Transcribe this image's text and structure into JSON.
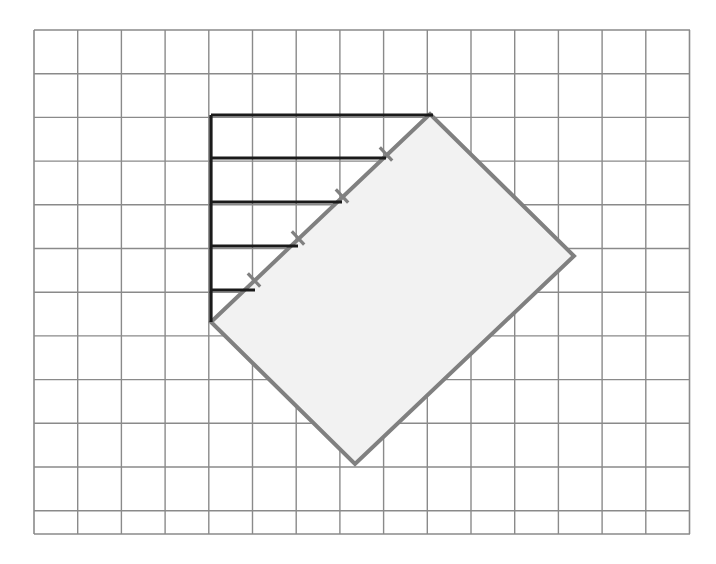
{
  "figure": {
    "canvas": {
      "width": 716,
      "height": 564,
      "background": "#ffffff"
    },
    "grid": {
      "name": "square-grid",
      "origin_x": 34,
      "origin_y": 30,
      "cell_size": 43.7,
      "columns": 15,
      "rows": 11.53,
      "width": 656,
      "height": 504,
      "line_color": "#8a8a8a",
      "line_width": 1.4,
      "border_color": "#8a8a8a",
      "border_width": 1.6,
      "visible": true
    },
    "shaded_rectangle": {
      "name": "rotated-rectangle",
      "fill": "#f2f2f2",
      "stroke": "#808080",
      "stroke_width": 4,
      "rotation_degrees": -43.5,
      "vertices": [
        {
          "label": "left",
          "x": 211,
          "y": 322
        },
        {
          "label": "top",
          "x": 430,
          "y": 114
        },
        {
          "label": "right",
          "x": 574,
          "y": 256
        },
        {
          "label": "bottom",
          "x": 355,
          "y": 464
        }
      ],
      "side_lengths_px": {
        "long": 302,
        "short": 202
      },
      "side_lengths_cells": {
        "long": 6.9,
        "short": 4.6
      }
    },
    "staircase": {
      "name": "black-staircase-polyline",
      "stroke": "#1a1a1a",
      "stroke_width": 3.2,
      "vertical_segment": {
        "x": 211,
        "y_top": 115,
        "y_bottom": 322
      },
      "horizontal_segments": [
        {
          "index": 1,
          "y": 115,
          "x_start": 211,
          "x_end": 433,
          "cells": 5
        },
        {
          "index": 2,
          "y": 158,
          "x_start": 211,
          "x_end": 386,
          "cells": 4
        },
        {
          "index": 3,
          "y": 202,
          "x_start": 211,
          "x_end": 342,
          "cells": 3
        },
        {
          "index": 4,
          "y": 246,
          "x_start": 211,
          "x_end": 298,
          "cells": 2
        },
        {
          "index": 5,
          "y": 290,
          "x_start": 211,
          "x_end": 255,
          "cells": 1
        }
      ]
    },
    "tick_marks": {
      "name": "edge-tick-marks",
      "stroke": "#808080",
      "stroke_width": 3.2,
      "length": 18,
      "count": 4,
      "description": "perpendicular congruence ticks on the upper-left edge of the rotated rectangle",
      "positions": [
        {
          "index": 1,
          "x": 254,
          "y": 280
        },
        {
          "index": 2,
          "x": 298,
          "y": 238
        },
        {
          "index": 3,
          "x": 342,
          "y": 196
        },
        {
          "index": 4,
          "x": 386,
          "y": 154
        }
      ]
    }
  }
}
